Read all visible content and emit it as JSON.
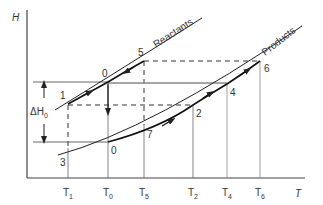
{
  "diagram": {
    "type": "enthalpy-temperature diagram",
    "axes": {
      "y_label": "H",
      "x_label": "T",
      "x_ticks": [
        {
          "id": "T1",
          "base": "T",
          "sub": "1"
        },
        {
          "id": "T0",
          "base": "T",
          "sub": "0"
        },
        {
          "id": "T5",
          "base": "T",
          "sub": "5"
        },
        {
          "id": "T2",
          "base": "T",
          "sub": "2"
        },
        {
          "id": "T4",
          "base": "T",
          "sub": "4"
        },
        {
          "id": "T6",
          "base": "T",
          "sub": "6"
        }
      ]
    },
    "curves": {
      "reactants": "Reactants",
      "products": "Products"
    },
    "points": {
      "p0_upper": "0",
      "p0_lower": "0",
      "p1": "1",
      "p2": "2",
      "p3": "3",
      "p4": "4",
      "p5": "5",
      "p6": "6",
      "p7": "7"
    },
    "delta_h": {
      "base": "ΔH",
      "sub": "0"
    },
    "colors": {
      "line": "#333333",
      "gray_line": "#888888"
    }
  }
}
